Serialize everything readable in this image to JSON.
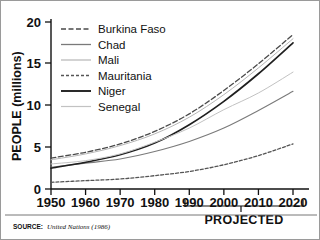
{
  "chart_data": {
    "type": "line",
    "title": "",
    "xlabel": "",
    "ylabel": "PEOPLE (millions)",
    "xlim": [
      1950,
      2020
    ],
    "ylim": [
      0,
      20
    ],
    "xticks": [
      "1950",
      "1960",
      "1970",
      "1980",
      "1990",
      "2000",
      "2010",
      "2020"
    ],
    "yticks": [
      "0",
      "5",
      "10",
      "15",
      "20"
    ],
    "grid": false,
    "legend_position": "top-left",
    "x": [
      1950,
      1960,
      1970,
      1980,
      1990,
      2000,
      2010,
      2020
    ],
    "series": [
      {
        "name": "Burkina Faso",
        "style": "long-dash",
        "color": "#4a4a4a",
        "values": [
          3.7,
          4.4,
          5.4,
          6.9,
          9.0,
          11.8,
          15.0,
          18.5
        ]
      },
      {
        "name": "Chad",
        "style": "solid-thin",
        "color": "#7a7a7a",
        "values": [
          2.6,
          3.1,
          3.6,
          4.5,
          5.7,
          7.3,
          9.4,
          11.7
        ]
      },
      {
        "name": "Mali",
        "style": "faint-thin",
        "color": "#b6b6b6",
        "values": [
          3.5,
          4.2,
          5.2,
          6.6,
          8.6,
          11.3,
          14.5,
          18.0
        ]
      },
      {
        "name": "Mauritania",
        "style": "short-dash",
        "color": "#555555",
        "values": [
          0.8,
          1.0,
          1.2,
          1.6,
          2.1,
          2.9,
          4.0,
          5.4
        ]
      },
      {
        "name": "Niger",
        "style": "solid-thick",
        "color": "#1f1f1f",
        "values": [
          2.5,
          3.2,
          4.1,
          5.5,
          7.7,
          10.5,
          13.8,
          17.5
        ]
      },
      {
        "name": "Senegal",
        "style": "faint-thin",
        "color": "#c2c2c2",
        "values": [
          3.0,
          3.4,
          4.2,
          5.6,
          7.3,
          9.5,
          11.5,
          14.0
        ]
      }
    ],
    "annotations": {
      "projected_label": "PROJECTED",
      "projected_range": [
        1985,
        2022
      ]
    }
  },
  "legend": {
    "items": [
      {
        "label": "Burkina Faso"
      },
      {
        "label": "Chad"
      },
      {
        "label": "Mali"
      },
      {
        "label": "Mauritania"
      },
      {
        "label": "Niger"
      },
      {
        "label": "Senegal"
      }
    ]
  },
  "axes": {
    "y_title": "PEOPLE (millions)",
    "y_ticks": [
      "20",
      "15",
      "10",
      "5",
      "0"
    ],
    "x_ticks": [
      "1950",
      "1960",
      "1970",
      "1980",
      "1990",
      "2000",
      "2010",
      "2020"
    ]
  },
  "footer": {
    "source_label": "SOURCE:",
    "source_text": "United Nations (1986)"
  }
}
